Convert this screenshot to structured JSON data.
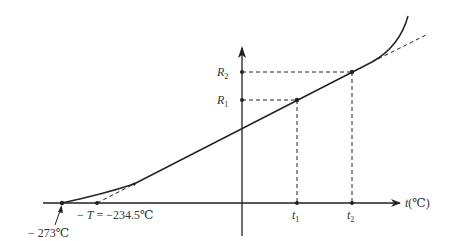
{
  "diagram": {
    "type": "resistance-temperature curve",
    "axes": {
      "x_label_var": "t",
      "x_label_unit": "(℃)",
      "y_label": ""
    },
    "y_ticks": [
      {
        "var": "R",
        "sub": "2"
      },
      {
        "var": "R",
        "sub": "1"
      }
    ],
    "x_ticks": [
      {
        "var": "t",
        "sub": "1"
      },
      {
        "var": "t",
        "sub": "2"
      }
    ],
    "annotations": {
      "abs_zero": "− 273℃",
      "neg_T_prefix": "− ",
      "neg_T_var": "T",
      "neg_T_value": " = −234.5℃"
    },
    "colors": {
      "stroke": "#222222",
      "background": "#ffffff"
    }
  }
}
